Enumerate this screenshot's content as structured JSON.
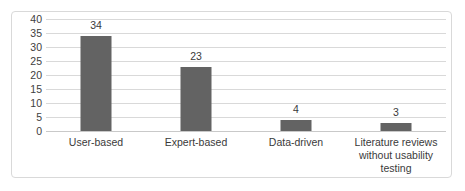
{
  "chart_data": {
    "type": "bar",
    "title": "",
    "subtitle": "",
    "xlabel": "",
    "ylabel": "",
    "categories": [
      "User-based",
      "Expert-based",
      "Data-driven",
      "Literature reviews without usability testing"
    ],
    "category_lines": [
      [
        "User-based"
      ],
      [
        "Expert-based"
      ],
      [
        "Data-driven"
      ],
      [
        "Literature reviews",
        "without usability",
        "testing"
      ]
    ],
    "values": [
      34,
      23,
      4,
      3
    ],
    "data_labels": [
      "34",
      "23",
      "4",
      "3"
    ],
    "ylim": [
      0,
      40
    ],
    "y_ticks": [
      40,
      35,
      30,
      25,
      20,
      15,
      10,
      5,
      0
    ],
    "y_tick_labels": [
      "40",
      "35",
      "30",
      "25",
      "20",
      "15",
      "10",
      "5",
      "0"
    ],
    "grid": true,
    "grid_axis": "y",
    "legend": false,
    "legend_position": "none",
    "series": [
      {
        "name": "",
        "values": [
          34,
          23,
          4,
          3
        ]
      }
    ],
    "colors": {
      "bar_fill": "#636363",
      "gridline": "#d9d9d9",
      "axis_text": "#404040",
      "label_text": "#3a3a3a",
      "frame_border": "#d9d9d9",
      "background": "#ffffff"
    }
  }
}
